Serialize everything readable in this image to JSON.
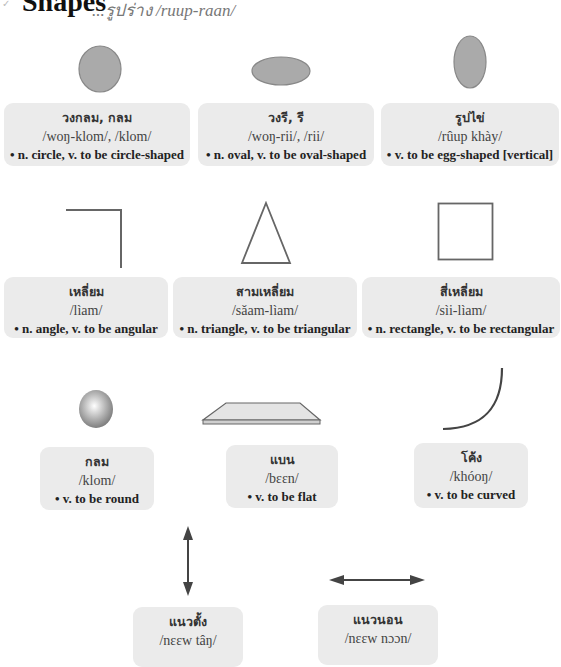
{
  "header": {
    "bullet_icon": "✓",
    "title": "Shapes",
    "subtitle": "...รูปร่าง /ruup-raan/"
  },
  "colors": {
    "card_bg": "#ebebeb",
    "shape_fill": "#aaaaaa",
    "shape_stroke": "#777777",
    "line": "#666666"
  },
  "cards": [
    {
      "id": "circle",
      "thai": "วงกลม, กลม",
      "phonetic": "/woŋ-klom/, /klom/",
      "definition": "• n. circle, v. to be circle-shaped"
    },
    {
      "id": "oval",
      "thai": "วงรี, รี",
      "phonetic": "/woŋ-rii/, /rii/",
      "definition": "• n. oval, v. to be oval-shaped"
    },
    {
      "id": "egg",
      "thai": "รูปไข่",
      "phonetic": "/rûup khày/",
      "definition": "• v. to be egg-shaped [vertical]"
    },
    {
      "id": "angle",
      "thai": "เหลี่ยม",
      "phonetic": "/lìam/",
      "definition": "• n. angle, v. to be angular"
    },
    {
      "id": "triangle",
      "thai": "สามเหลี่ยม",
      "phonetic": "/sǎam-lìam/",
      "definition": "• n. triangle, v. to be triangular"
    },
    {
      "id": "rectangle",
      "thai": "สี่เหลี่ยม",
      "phonetic": "/sìi-lìam/",
      "definition": "• n. rectangle, v. to be rectangular"
    },
    {
      "id": "round",
      "thai": "กลม",
      "phonetic": "/klom/",
      "definition": "• v. to be round"
    },
    {
      "id": "flat",
      "thai": "แบน",
      "phonetic": "/bɛɛn/",
      "definition": "• v. to be flat"
    },
    {
      "id": "curved",
      "thai": "โค้ง",
      "phonetic": "/khóoŋ/",
      "definition": "• v. to be curved"
    },
    {
      "id": "vertical",
      "thai": "แนวตั้ง",
      "phonetic": "/nɛɛw tâŋ/",
      "definition": ""
    },
    {
      "id": "horizontal",
      "thai": "แนวนอน",
      "phonetic": "/nɛɛw nɔɔn/",
      "definition": ""
    }
  ]
}
